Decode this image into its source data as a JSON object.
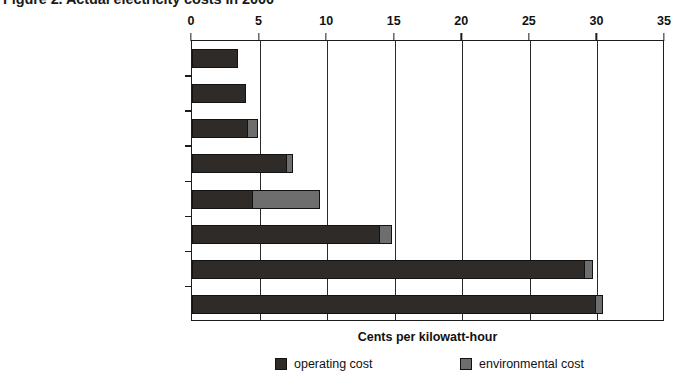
{
  "chart_data": {
    "type": "bar",
    "orientation": "horizontal",
    "stacked": true,
    "title": "Figure 2. Actual electricity costs in 2000",
    "xlabel": "Cents per kilowatt-hour",
    "ylabel": "",
    "xlim": [
      0,
      35
    ],
    "xticks": [
      0,
      5,
      10,
      15,
      20,
      25,
      30,
      35
    ],
    "xtick_labels": [
      "0",
      "5",
      "10",
      "15",
      "20",
      "25",
      "30",
      "35"
    ],
    "grid": true,
    "grid_axis": "x",
    "legend_position": "bottom",
    "categories": [
      "Geothermal (hydrothermal)",
      "Wind turbines (class 6 site)",
      "Advanced combined-cycle",
      "Biomass (gasification-based)",
      "Advanced coal",
      "Solar thermal (power tower)",
      "Photovoltaic (utility scale)",
      "Photovoltaic (residential)"
    ],
    "series": [
      {
        "name": "operating cost",
        "color": "#2e2b29",
        "values": [
          3.4,
          4.0,
          4.1,
          7.0,
          4.4,
          13.9,
          29.1,
          29.9
        ]
      },
      {
        "name": "environmental cost",
        "color": "#6e6e6e",
        "values": [
          0.0,
          0.0,
          0.8,
          0.5,
          5.1,
          0.9,
          0.6,
          0.5
        ]
      }
    ],
    "totals": [
      3.4,
      4.0,
      4.9,
      7.5,
      9.5,
      14.8,
      29.7,
      30.4
    ]
  },
  "legend": {
    "entries": [
      {
        "label": "operating cost",
        "color": "#2e2b29"
      },
      {
        "label": "environmental cost",
        "color": "#6e6e6e"
      }
    ]
  }
}
